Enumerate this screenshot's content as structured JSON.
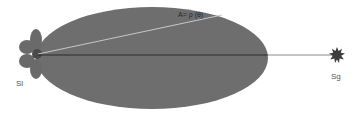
{
  "diagram": {
    "type": "antenna-radiation-pattern",
    "colors": {
      "background": "#ffffff",
      "main_lobe": "#6e6e6e",
      "side_lobes": "#6a6a6a",
      "source_core": "#4a4a4a",
      "boresight_line": "#2a2a2a",
      "radius_line": "#c8c8c8",
      "target": "#3c3c3c"
    },
    "labels": {
      "radius_formula": "A= ρ (θ)",
      "source": "Sl",
      "target": "Sg"
    },
    "nodes": [
      {
        "id": "source",
        "label": "Sl",
        "shape": "flower (4 side lobes + core)"
      },
      {
        "id": "target",
        "label": "Sg",
        "shape": "starburst"
      }
    ],
    "edges": [
      {
        "from": "source",
        "to": "target",
        "style": "dark line (boresight)"
      },
      {
        "from": "source",
        "to": "main-lobe-edge",
        "style": "light line",
        "label": "A= ρ (θ)"
      }
    ]
  }
}
